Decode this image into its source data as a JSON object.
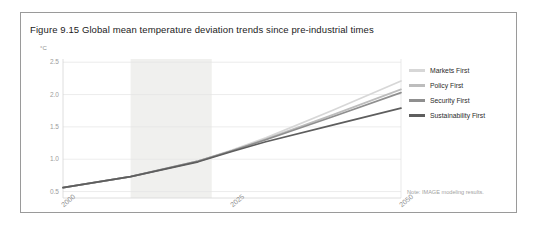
{
  "figure": {
    "title": "Figure 9.15 Global mean temperature deviation trends since pre-industrial times",
    "note": "Note: IMAGE modeling results.",
    "frame_color": "#9a9a9a",
    "background": "#ffffff"
  },
  "chart_data": {
    "type": "line",
    "title": "Figure 9.15 Global mean temperature deviation trends since pre-industrial times",
    "xlabel": "",
    "ylabel": "°C",
    "ylim": [
      0.4,
      2.55
    ],
    "xlim": [
      2000,
      2050
    ],
    "yticks": [
      0.5,
      1.0,
      1.5,
      2.0,
      2.5
    ],
    "ytick_labels": [
      "0.5",
      "1.0",
      "1.5",
      "2.0",
      "2.5"
    ],
    "xticks": [
      2000,
      2025,
      2050
    ],
    "xtick_labels": [
      "2000",
      "2025",
      "2050"
    ],
    "grid": "horizontal",
    "legend_position": "right",
    "shaded_band": {
      "x0": 2010,
      "x1": 2022,
      "color": "#f0f0ee",
      "label": ""
    },
    "x": [
      2000,
      2010,
      2020,
      2025,
      2030,
      2040,
      2050
    ],
    "series": [
      {
        "name": "Markets First",
        "color": "#d7d7d7",
        "values": [
          0.56,
          0.73,
          0.97,
          1.14,
          1.33,
          1.76,
          2.21
        ]
      },
      {
        "name": "Policy First",
        "color": "#bdbdbd",
        "values": [
          0.56,
          0.73,
          0.97,
          1.13,
          1.31,
          1.69,
          2.08
        ]
      },
      {
        "name": "Security First",
        "color": "#8f8f8f",
        "values": [
          0.56,
          0.73,
          0.97,
          1.13,
          1.3,
          1.66,
          2.03
        ]
      },
      {
        "name": "Sustainability First",
        "color": "#5e5e5e",
        "values": [
          0.56,
          0.73,
          0.96,
          1.12,
          1.27,
          1.53,
          1.79
        ]
      }
    ]
  },
  "yaxis": {
    "unit_label": "°C",
    "ticks": [
      "2.5",
      "2.0",
      "1.5",
      "1.0",
      "0.5"
    ]
  },
  "xaxis": {
    "ticks": [
      "2000",
      "2025",
      "2050"
    ]
  },
  "legend": {
    "items": [
      {
        "label": "Markets First",
        "color": "#d7d7d7"
      },
      {
        "label": "Policy First",
        "color": "#bdbdbd"
      },
      {
        "label": "Security First",
        "color": "#8f8f8f"
      },
      {
        "label": "Sustainability First",
        "color": "#5e5e5e"
      }
    ]
  }
}
